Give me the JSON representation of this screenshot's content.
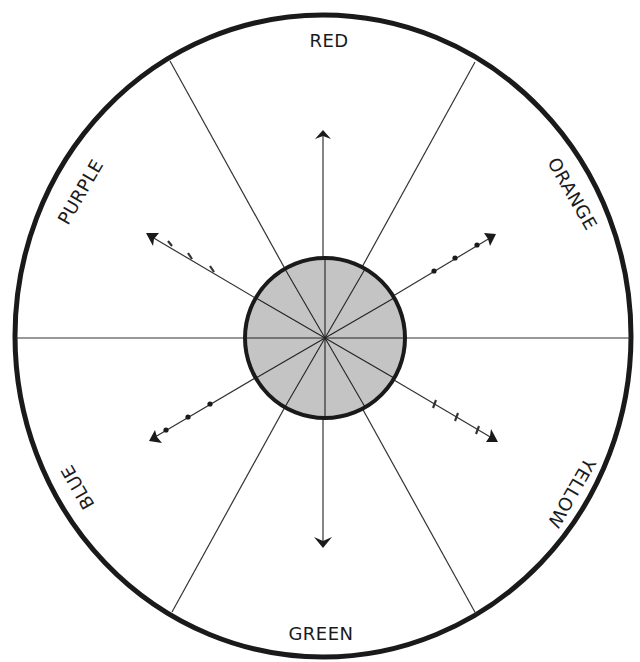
{
  "diagram": {
    "colors": {
      "ink": "#1a1a1a",
      "center_fill": "#c4c4c4",
      "background": "#ffffff"
    },
    "labels": {
      "top": "RED",
      "top_right": "ORANGE",
      "bottom_right": "YELLOW",
      "bottom": "GREEN",
      "bottom_left": "BLUE",
      "top_left": "PURPLE"
    },
    "segments": [
      "RED",
      "ORANGE",
      "YELLOW",
      "GREEN",
      "BLUE",
      "PURPLE"
    ],
    "arrows": [
      {
        "direction": "up",
        "markers": "none"
      },
      {
        "direction": "up-right",
        "markers": "dots",
        "count": 3
      },
      {
        "direction": "down-right",
        "markers": "ticks",
        "count": 3
      },
      {
        "direction": "down",
        "markers": "none"
      },
      {
        "direction": "down-left",
        "markers": "dots",
        "count": 3
      },
      {
        "direction": "up-left",
        "markers": "ticks",
        "count": 3
      }
    ],
    "center_disc": {
      "divisions": 12,
      "shaded": true
    }
  }
}
